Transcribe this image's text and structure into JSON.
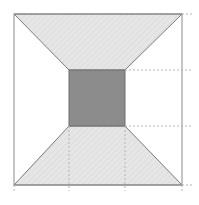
{
  "diagram": {
    "colors": {
      "background": "#ffffff",
      "outer_border": "#8a8a8a",
      "face_fill": "#e4e4e4",
      "top_square_fill": "#8c8c8c",
      "edge_line": "#7a7a7a",
      "dashed_line": "#b5b5b5"
    },
    "outer_square": {
      "x1": 14,
      "y1": 14,
      "x2": 182,
      "y2": 185
    },
    "inner_square": {
      "x1": 69,
      "y1": 70,
      "x2": 125,
      "y2": 126
    },
    "shaded_faces": [
      "top",
      "bottom"
    ],
    "dashed_extensions": {
      "horizontal_y": [
        14,
        70,
        126,
        185
      ],
      "vertical_x": [
        14,
        69,
        125,
        182
      ]
    }
  }
}
